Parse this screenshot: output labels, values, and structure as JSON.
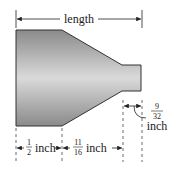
{
  "diagram": {
    "length_label": "length",
    "dim_left": {
      "numerator": "1",
      "denominator": "2",
      "unit": "inch"
    },
    "dim_middle": {
      "numerator": "11",
      "denominator": "16",
      "unit": "inch"
    },
    "dim_right": {
      "numerator": "9",
      "denominator": "32",
      "unit": "inch"
    },
    "colors": {
      "body_light": "#d8d8d8",
      "body_dark": "#8a8a8a",
      "outline": "#333333",
      "lines": "#222222"
    }
  }
}
